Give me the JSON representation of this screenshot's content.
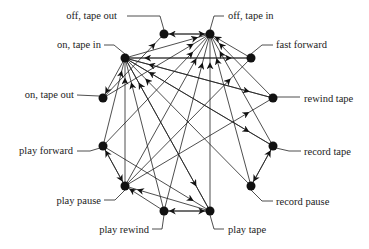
{
  "diagram": {
    "type": "state-transition graph",
    "nodes": [
      {
        "id": "off_tape_out",
        "label": "off, tape out",
        "x": 164,
        "y": 34,
        "lx": 117,
        "ly": 19,
        "anchor": "end",
        "lead": "M127,16 L160,16 L164,30"
      },
      {
        "id": "off_tape_in",
        "label": "off, tape in",
        "x": 210,
        "y": 34,
        "lx": 228,
        "ly": 19,
        "anchor": "start",
        "lead": "M224,16 L214,16 L210,30"
      },
      {
        "id": "on_tape_in",
        "label": "on, tape in",
        "x": 125,
        "y": 58,
        "lx": 101,
        "ly": 48,
        "anchor": "end",
        "lead": "M104,45 L114,45 L125,54"
      },
      {
        "id": "fast_forward",
        "label": "fast forward",
        "x": 251,
        "y": 58,
        "lx": 276,
        "ly": 48,
        "anchor": "start",
        "lead": "M273,45 L262,45 L251,54"
      },
      {
        "id": "on_tape_out",
        "label": "on, tape out",
        "x": 103,
        "y": 98,
        "lx": 74,
        "ly": 98,
        "anchor": "end",
        "lead": "M77,95 L99,96"
      },
      {
        "id": "rewind_tape",
        "label": "rewind tape",
        "x": 273,
        "y": 98,
        "lx": 304,
        "ly": 102,
        "anchor": "start",
        "lead": "M300,97 L277,97"
      },
      {
        "id": "play_forward",
        "label": "play forward",
        "x": 103,
        "y": 146,
        "lx": 73,
        "ly": 154,
        "anchor": "end",
        "lead": "M77,151 L90,151 L100,148"
      },
      {
        "id": "record_tape",
        "label": "record tape",
        "x": 273,
        "y": 146,
        "lx": 304,
        "ly": 155,
        "anchor": "start",
        "lead": "M301,151 L289,151 L276,148"
      },
      {
        "id": "play_pause",
        "label": "play pause",
        "x": 125,
        "y": 186,
        "lx": 101,
        "ly": 204,
        "anchor": "end",
        "lead": "M104,200 L115,200 L125,190"
      },
      {
        "id": "record_pause",
        "label": "record pause",
        "x": 251,
        "y": 186,
        "lx": 276,
        "ly": 205,
        "anchor": "start",
        "lead": "M273,201 L262,201 L251,190"
      },
      {
        "id": "play_rewind",
        "label": "play rewind",
        "x": 164,
        "y": 211,
        "lx": 149,
        "ly": 233,
        "anchor": "end",
        "lead": "M152,229 L162,229 L164,215"
      },
      {
        "id": "play_tape",
        "label": "play tape",
        "x": 210,
        "y": 211,
        "lx": 228,
        "ly": 233,
        "anchor": "start",
        "lead": "M224,229 L214,229 L210,215"
      }
    ],
    "edges": [
      [
        "off_tape_in",
        "off_tape_out"
      ],
      [
        "on_tape_in",
        "off_tape_in"
      ],
      [
        "on_tape_out",
        "off_tape_out"
      ],
      [
        "on_tape_in",
        "on_tape_out"
      ],
      [
        "fast_forward",
        "off_tape_in"
      ],
      [
        "rewind_tape",
        "off_tape_in"
      ],
      [
        "play_forward",
        "off_tape_in"
      ],
      [
        "record_tape",
        "off_tape_in"
      ],
      [
        "play_pause",
        "off_tape_in"
      ],
      [
        "record_pause",
        "off_tape_in"
      ],
      [
        "play_rewind",
        "off_tape_in"
      ],
      [
        "play_tape",
        "off_tape_in"
      ],
      [
        "on_tape_out",
        "off_tape_in"
      ],
      [
        "fast_forward",
        "on_tape_in"
      ],
      [
        "rewind_tape",
        "on_tape_in"
      ],
      [
        "play_forward",
        "on_tape_in"
      ],
      [
        "record_tape",
        "on_tape_in"
      ],
      [
        "play_pause",
        "on_tape_in"
      ],
      [
        "record_pause",
        "on_tape_in"
      ],
      [
        "play_rewind",
        "on_tape_in"
      ],
      [
        "play_tape",
        "on_tape_in"
      ],
      [
        "on_tape_in",
        "fast_forward"
      ],
      [
        "on_tape_in",
        "rewind_tape"
      ],
      [
        "on_tape_in",
        "record_tape"
      ],
      [
        "on_tape_in",
        "play_tape"
      ],
      [
        "play_forward",
        "play_pause"
      ],
      [
        "play_pause",
        "play_forward"
      ],
      [
        "play_rewind",
        "play_pause"
      ],
      [
        "play_tape",
        "play_pause"
      ],
      [
        "play_tape",
        "play_rewind"
      ],
      [
        "play_rewind",
        "play_tape"
      ],
      [
        "record_tape",
        "record_pause"
      ],
      [
        "record_pause",
        "record_tape"
      ],
      [
        "play_forward",
        "play_tape"
      ],
      [
        "play_pause",
        "fast_forward"
      ],
      [
        "play_pause",
        "rewind_tape"
      ],
      [
        "off_tape_out",
        "off_tape_in"
      ]
    ]
  }
}
